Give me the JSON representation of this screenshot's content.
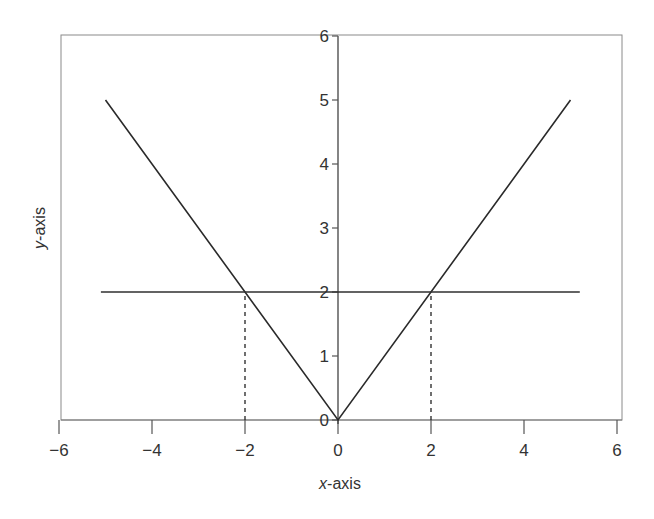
{
  "chart_data": {
    "type": "line",
    "title": "",
    "xlabel": "x-axis",
    "ylabel": "y-axis",
    "xlabel_parts": {
      "italic": "x",
      "rest": "-axis"
    },
    "ylabel_parts": {
      "italic": "y",
      "rest": "-axis"
    },
    "xlim": [
      -6,
      6
    ],
    "ylim": [
      0,
      6
    ],
    "xticks": [
      -6,
      -4,
      -2,
      0,
      2,
      4,
      6
    ],
    "xtick_labels": [
      "−6",
      "−4",
      "−2",
      "0",
      "2",
      "4",
      "6"
    ],
    "yticks": [
      0,
      1,
      2,
      3,
      4,
      5,
      6
    ],
    "ytick_labels": [
      "0",
      "1",
      "2",
      "3",
      "4",
      "5",
      "6"
    ],
    "grid": false,
    "legend": null,
    "series": [
      {
        "name": "y = |x|",
        "style": "solid",
        "x": [
          -5,
          0,
          5
        ],
        "y": [
          5,
          0,
          5
        ]
      },
      {
        "name": "y = 2",
        "style": "solid",
        "x": [
          -5.1,
          5.2
        ],
        "y": [
          2,
          2
        ]
      },
      {
        "name": "drop line x = -2",
        "style": "dashed",
        "x": [
          -2,
          -2
        ],
        "y": [
          0,
          2
        ]
      },
      {
        "name": "drop line x = 2",
        "style": "dashed",
        "x": [
          2,
          2
        ],
        "y": [
          0,
          2
        ]
      }
    ],
    "intersections": [
      {
        "x": -2,
        "y": 2
      },
      {
        "x": 2,
        "y": 2
      }
    ]
  },
  "layout": {
    "frame": {
      "left": 61,
      "top": 35,
      "right": 622,
      "bottom": 420
    },
    "x0_px": 338,
    "x_unit_px": 46.5,
    "y0_px": 420,
    "y_unit_px": 64
  },
  "colors": {
    "line": "#2a2a2a",
    "frame": "#8a8a8a",
    "text": "#333333",
    "background": "#ffffff"
  }
}
